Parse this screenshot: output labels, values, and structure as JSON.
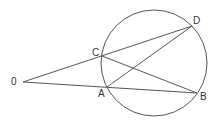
{
  "diagram": {
    "type": "circle-secants",
    "stroke_color": "#555555",
    "circle": {
      "cx": 154,
      "cy": 63,
      "r": 53
    },
    "points": {
      "O": {
        "label": "0",
        "x": 23,
        "y": 82
      },
      "C": {
        "label": "C",
        "x": 102,
        "y": 56
      },
      "D": {
        "label": "D",
        "x": 192,
        "y": 26
      },
      "A": {
        "label": "A",
        "x": 107,
        "y": 87
      },
      "B": {
        "label": "B",
        "x": 197,
        "y": 93
      }
    },
    "segments": [
      [
        "O",
        "D"
      ],
      [
        "O",
        "B"
      ],
      [
        "C",
        "B"
      ],
      [
        "A",
        "D"
      ]
    ]
  }
}
